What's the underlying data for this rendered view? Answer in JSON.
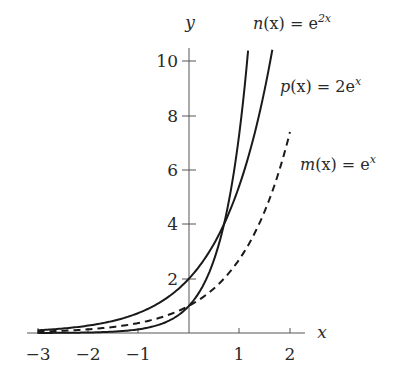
{
  "chart_data": {
    "type": "line",
    "title": "",
    "xlabel": "x",
    "ylabel": "y",
    "xlim": [
      -3,
      2.3
    ],
    "ylim": [
      0,
      10.5
    ],
    "grid": false,
    "legend": "inline labels at curve ends",
    "x_ticks": [
      -3,
      -2,
      -1,
      1,
      2
    ],
    "y_ticks": [
      2,
      4,
      6,
      8,
      10
    ],
    "series": [
      {
        "name": "n(x) = e^{2x}",
        "style": "solid",
        "x": [
          -3,
          -2,
          -1,
          -0.5,
          0,
          0.5,
          0.69,
          1.0,
          1.17
        ],
        "y": [
          0.0025,
          0.018,
          0.135,
          0.368,
          1,
          2.718,
          4.0,
          7.389,
          10.4
        ]
      },
      {
        "name": "p(x) = 2e^x",
        "style": "solid",
        "x": [
          -3,
          -2,
          -1,
          -0.5,
          0,
          0.5,
          0.69,
          1.0,
          1.5,
          1.65
        ],
        "y": [
          0.1,
          0.271,
          0.736,
          1.213,
          2,
          3.297,
          4.0,
          5.437,
          8.963,
          10.4
        ]
      },
      {
        "name": "m(x) = e^x",
        "style": "dashed",
        "x": [
          -3,
          -2,
          -1,
          0,
          0.5,
          1,
          1.5,
          2
        ],
        "y": [
          0.05,
          0.135,
          0.368,
          1,
          1.649,
          2.718,
          4.482,
          7.389
        ]
      }
    ],
    "annotations": [
      {
        "text": "n(x) = e^{2x}",
        "near": "top of steepest curve"
      },
      {
        "text": "p(x) = 2e^x",
        "near": "top of middle curve"
      },
      {
        "text": "m(x) = e^x",
        "near": "end of dashed curve"
      }
    ]
  },
  "labels": {
    "x_axis": "x",
    "y_axis": "y",
    "x_ticks": [
      "−3",
      "−2",
      "−1",
      "1",
      "2"
    ],
    "y_ticks": [
      "2",
      "4",
      "6",
      "8",
      "10"
    ],
    "n": {
      "name": "n",
      "arg": "(x) = e",
      "exp": "2x"
    },
    "p": {
      "name": "p",
      "arg": "(x) = 2e",
      "exp": "x"
    },
    "m": {
      "name": "m",
      "arg": "(x) = e",
      "exp": "x"
    }
  }
}
